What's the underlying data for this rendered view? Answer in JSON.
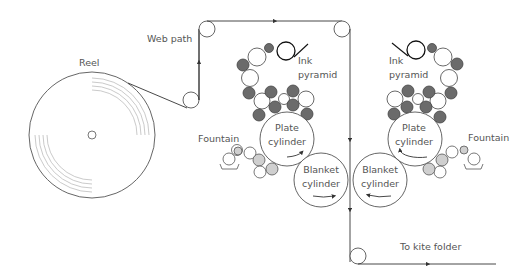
{
  "diagram": {
    "labels": {
      "reel": "Reel",
      "web_path": "Web path",
      "ink_pyramid_left_1": "Ink",
      "ink_pyramid_left_2": "pyramid",
      "ink_pyramid_right_1": "Ink",
      "ink_pyramid_right_2": "pyramid",
      "fountain_left": "Fountain",
      "fountain_right": "Fountain",
      "plate_left_1": "Plate",
      "plate_left_2": "cylinder",
      "plate_right_1": "Plate",
      "plate_right_2": "cylinder",
      "blanket_left_1": "Blanket",
      "blanket_left_2": "cylinder",
      "blanket_right_1": "Blanket",
      "blanket_right_2": "cylinder",
      "to_kite_folder": "To kite folder"
    },
    "colors": {
      "line": "#333333",
      "dark_roller": "#6b6b6b",
      "light_roller": "#cfcfcf",
      "reel_rings": "#bdbdbd",
      "text": "#555555"
    }
  }
}
